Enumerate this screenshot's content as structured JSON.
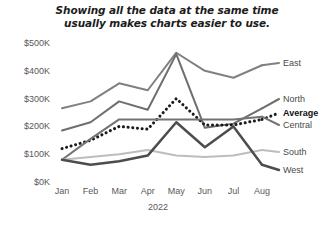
{
  "chart_data": {
    "type": "line",
    "title": "Showing all the data at the same time\nusually makes charts easier to use.",
    "xlabel": "2022",
    "ylabel": "",
    "categories": [
      "Jan",
      "Feb",
      "Mar",
      "Apr",
      "May",
      "Jun",
      "Jul",
      "Aug"
    ],
    "ylim": [
      0,
      500000
    ],
    "ytick_labels": [
      "$500K",
      "$400K",
      "$300K",
      "$200K",
      "$100K",
      "$0K"
    ],
    "ytick_values": [
      500000,
      400000,
      300000,
      200000,
      100000,
      0
    ],
    "grid": false,
    "legend_position": "right-inline",
    "series": [
      {
        "name": "East",
        "color": "#808080",
        "style": "solid",
        "width": 2,
        "emphasis": false,
        "values": [
          265000,
          290000,
          355000,
          330000,
          465000,
          400000,
          375000,
          420000
        ]
      },
      {
        "name": "North",
        "color": "#6e6e6e",
        "style": "solid",
        "width": 2,
        "emphasis": false,
        "values": [
          185000,
          215000,
          290000,
          260000,
          460000,
          195000,
          210000,
          265000
        ]
      },
      {
        "name": "Average",
        "color": "#1a1a1a",
        "style": "dotted",
        "width": 3,
        "emphasis": true,
        "values": [
          120000,
          150000,
          200000,
          190000,
          300000,
          205000,
          205000,
          225000
        ]
      },
      {
        "name": "Central",
        "color": "#737373",
        "style": "solid",
        "width": 2,
        "emphasis": false,
        "values": [
          80000,
          155000,
          225000,
          225000,
          225000,
          225000,
          225000,
          235000
        ]
      },
      {
        "name": "South",
        "color": "#bdbdbd",
        "style": "solid",
        "width": 2,
        "emphasis": false,
        "values": [
          80000,
          90000,
          100000,
          115000,
          95000,
          90000,
          95000,
          115000
        ]
      },
      {
        "name": "West",
        "color": "#4d4d4d",
        "style": "solid",
        "width": 2.5,
        "emphasis": false,
        "values": [
          80000,
          62000,
          75000,
          95000,
          215000,
          125000,
          200000,
          62000
        ]
      }
    ]
  },
  "legend_labels": [
    {
      "text": "East",
      "y": 58,
      "bold": false
    },
    {
      "text": "North",
      "y": 94,
      "bold": false
    },
    {
      "text": "Average",
      "y": 108,
      "bold": true
    },
    {
      "text": "Central",
      "y": 120,
      "bold": false
    },
    {
      "text": "South",
      "y": 147,
      "bold": false
    },
    {
      "text": "West",
      "y": 165,
      "bold": false
    }
  ]
}
